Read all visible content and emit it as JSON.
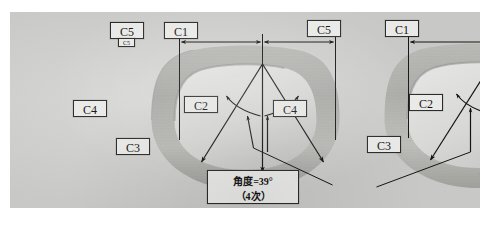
{
  "figure": {
    "type": "annotated-photograph",
    "background_color": "#cccccb",
    "line_color": "#1a1a1a",
    "label_fill": "#e9e9e7"
  },
  "panels": [
    {
      "id": "left",
      "name": "left-view",
      "dimension_line": {
        "left_label": "C5",
        "right_label": "C1",
        "sub_label": "C5"
      },
      "callouts": [
        {
          "key": "c1",
          "text": "C1"
        },
        {
          "key": "c2",
          "text": "C2"
        },
        {
          "key": "c3",
          "text": "C3"
        },
        {
          "key": "c4",
          "text": "C4"
        },
        {
          "key": "c5",
          "text": "C5"
        },
        {
          "key": "c5small",
          "text": "C5"
        }
      ]
    },
    {
      "id": "right",
      "name": "right-view",
      "dimension_line": {
        "left_label": "C5",
        "right_label": "C1",
        "sub_label": ""
      },
      "callouts": [
        {
          "key": "c1",
          "text": "C1"
        },
        {
          "key": "c2",
          "text": "C2"
        },
        {
          "key": "c3",
          "text": "C3"
        },
        {
          "key": "c4",
          "text": "C4"
        },
        {
          "key": "c5",
          "text": "C5"
        }
      ]
    }
  ],
  "note": {
    "line1": "角度=39°",
    "line2": "（4次）"
  }
}
